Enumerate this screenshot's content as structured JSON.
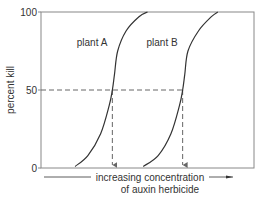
{
  "chart_data": {
    "type": "line",
    "title": "",
    "xlabel_line1": "increasing concentration",
    "xlabel_line2": "of auxin herbicide",
    "ylabel": "percent kill",
    "ylim": [
      0,
      100
    ],
    "yticks": [
      "0",
      "50",
      "100"
    ],
    "ytick_values": [
      0,
      50,
      100
    ],
    "xlim": [
      0,
      100
    ],
    "reference_level": 50,
    "series": [
      {
        "name": "plant A",
        "label": "plant A",
        "x": [
          16,
          22,
          28,
          32,
          33.5,
          34.5,
          36,
          40,
          46,
          50
        ],
        "y": [
          1,
          8,
          22,
          40,
          50,
          60,
          75,
          88,
          97,
          100
        ],
        "ld50_x": 33.5
      },
      {
        "name": "plant B",
        "label": "plant B",
        "x": [
          48,
          55,
          61,
          65,
          66.5,
          67.5,
          69,
          74,
          80,
          83
        ],
        "y": [
          1,
          8,
          22,
          40,
          50,
          60,
          75,
          88,
          97,
          100
        ],
        "ld50_x": 66.5
      }
    ],
    "grid": false,
    "legend": "none",
    "colors": {
      "axis": "#888888",
      "curve": "#333333",
      "dashed": "#666666",
      "text": "#333333"
    }
  }
}
